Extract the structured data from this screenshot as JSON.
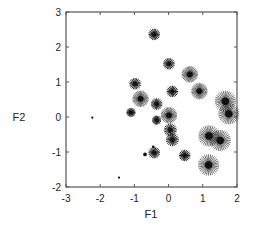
{
  "chart_data": {
    "type": "scatter",
    "title": "",
    "xlabel": "F1",
    "ylabel": "F2",
    "xlim": [
      -3,
      2
    ],
    "ylim": [
      -2,
      3
    ],
    "xticks": [
      -3,
      -2,
      -1,
      0,
      1,
      2
    ],
    "yticks": [
      -2,
      -1,
      0,
      1,
      2,
      3
    ],
    "xtick_labels": [
      "-3",
      "-2",
      "-1",
      "0",
      "1",
      "2"
    ],
    "ytick_labels": [
      "-2",
      "-1",
      "0",
      "1",
      "2",
      "3"
    ],
    "grid": false,
    "legend": null,
    "marker": "asterisk-star, size varies per point",
    "marker_color": "#111111",
    "frame_color": "#555555",
    "points": [
      {
        "x": -0.42,
        "y": 2.36,
        "size": 2
      },
      {
        "x": 0.01,
        "y": 1.52,
        "size": 2
      },
      {
        "x": 0.62,
        "y": 1.22,
        "size": 3
      },
      {
        "x": -0.98,
        "y": 0.95,
        "size": 2
      },
      {
        "x": 0.11,
        "y": 0.73,
        "size": 2
      },
      {
        "x": 0.9,
        "y": 0.74,
        "size": 3
      },
      {
        "x": -0.82,
        "y": 0.52,
        "size": 3
      },
      {
        "x": -0.35,
        "y": 0.37,
        "size": 2
      },
      {
        "x": -1.1,
        "y": 0.13,
        "size": 1.5
      },
      {
        "x": -2.23,
        "y": -0.02,
        "size": 0.6
      },
      {
        "x": 0.01,
        "y": 0.05,
        "size": 3
      },
      {
        "x": -0.35,
        "y": -0.09,
        "size": 1.5
      },
      {
        "x": 1.66,
        "y": 0.45,
        "size": 4
      },
      {
        "x": 1.76,
        "y": 0.09,
        "size": 4
      },
      {
        "x": 0.05,
        "y": -0.37,
        "size": 2.3
      },
      {
        "x": 0.11,
        "y": -0.65,
        "size": 2.3
      },
      {
        "x": 1.18,
        "y": -0.54,
        "size": 4
      },
      {
        "x": 1.51,
        "y": -0.67,
        "size": 4
      },
      {
        "x": -0.45,
        "y": -0.85,
        "size": 0.8
      },
      {
        "x": -0.69,
        "y": -1.07,
        "size": 1.3
      },
      {
        "x": -0.42,
        "y": -1.02,
        "size": 2
      },
      {
        "x": 0.47,
        "y": -1.1,
        "size": 2
      },
      {
        "x": 1.17,
        "y": -1.37,
        "size": 4
      },
      {
        "x": -1.45,
        "y": -1.73,
        "size": 0.6
      }
    ]
  }
}
